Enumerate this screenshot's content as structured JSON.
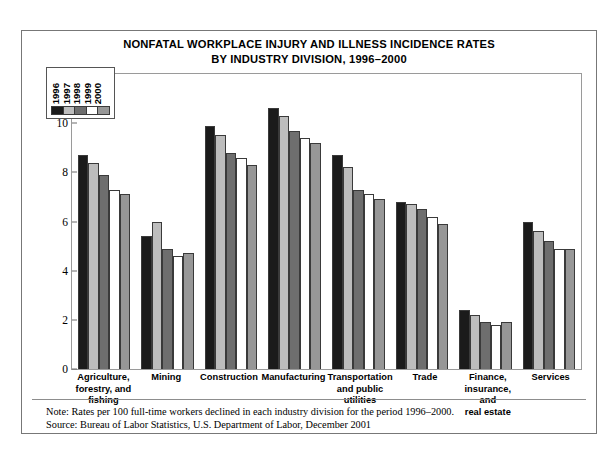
{
  "title": {
    "line1": "NONFATAL WORKPLACE INJURY AND ILLNESS INCIDENCE RATES",
    "line2": "BY INDUSTRY DIVISION, 1996–2000"
  },
  "notes": {
    "note": "Note: Rates per 100 full-time workers declined in each industry division for the period 1996–2000.",
    "source": "Source: Bureau of Labor Statistics, U.S. Department of Labor, December 2001"
  },
  "chart_data": {
    "type": "bar",
    "title": "NONFATAL WORKPLACE INJURY AND ILLNESS INCIDENCE RATES BY INDUSTRY DIVISION, 1996–2000",
    "xlabel": "",
    "ylabel": "Incidence rates per 100 full-time workers",
    "ylim": [
      0,
      12
    ],
    "yticks": [
      0,
      2,
      4,
      6,
      8,
      10,
      12
    ],
    "ytick_labels": [
      "0",
      "2",
      "4",
      "6",
      "8",
      "10",
      "12"
    ],
    "grid": false,
    "legend_position": "upper-left",
    "categories": [
      "Agriculture, forestry, and fishing",
      "Mining",
      "Construction",
      "Manufacturing",
      "Transportation and public utilities",
      "Trade",
      "Finance, insurance, and real estate",
      "Services"
    ],
    "category_lines": [
      [
        "Agriculture,",
        "forestry, and",
        "fishing"
      ],
      [
        "Mining"
      ],
      [
        "Construction"
      ],
      [
        "Manufacturing"
      ],
      [
        "Transportation",
        "and public utilities"
      ],
      [
        "Trade"
      ],
      [
        "Finance,",
        "insurance, and",
        "real estate"
      ],
      [
        "Services"
      ]
    ],
    "series": [
      {
        "name": "1996",
        "color": "#1b1b1b",
        "values": [
          8.7,
          5.4,
          9.9,
          10.6,
          8.7,
          6.8,
          2.4,
          6.0
        ]
      },
      {
        "name": "1997",
        "color": "#bdbdbd",
        "values": [
          8.4,
          6.0,
          9.5,
          10.3,
          8.2,
          6.7,
          2.2,
          5.6
        ]
      },
      {
        "name": "1998",
        "color": "#6e6e6e",
        "values": [
          7.9,
          4.9,
          8.8,
          9.7,
          7.3,
          6.5,
          1.9,
          5.2
        ]
      },
      {
        "name": "1999",
        "color": "#ffffff",
        "values": [
          7.3,
          4.6,
          8.6,
          9.4,
          7.1,
          6.2,
          1.8,
          4.9
        ]
      },
      {
        "name": "2000",
        "color": "#979797",
        "values": [
          7.1,
          4.7,
          8.3,
          9.2,
          6.9,
          5.9,
          1.9,
          4.9
        ]
      }
    ]
  }
}
